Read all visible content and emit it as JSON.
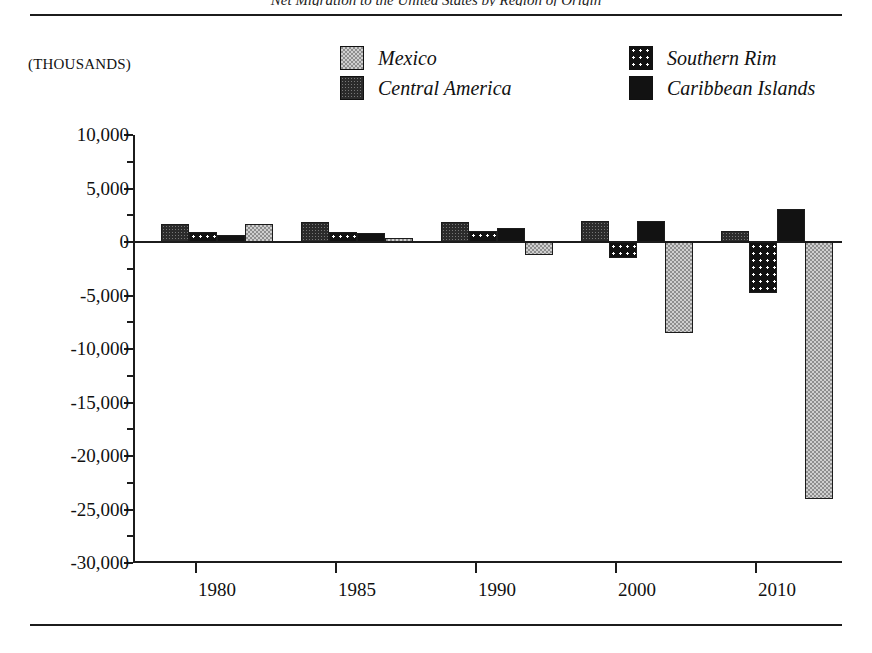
{
  "figure": {
    "clipped_title": "Net Migration to the United States by Region of Origin",
    "units_label": "(THOUSANDS)"
  },
  "legend": {
    "entries": [
      {
        "label": "Mexico",
        "key": "mexico",
        "swatch": "gray-checkered-swatch"
      },
      {
        "label": "Southern Rim",
        "key": "southern",
        "swatch": "black-dotted-swatch"
      },
      {
        "label": "Central America",
        "key": "central",
        "swatch": "dark-stippled-swatch"
      },
      {
        "label": "Caribbean Islands",
        "key": "caribbean",
        "swatch": "solid-black-swatch"
      }
    ]
  },
  "chart_data": {
    "type": "bar",
    "title": "Net Migration to the United States by Region of Origin",
    "xlabel": "",
    "ylabel": "(THOUSANDS)",
    "ylim": [
      -30000,
      10000
    ],
    "ytick_step": 5000,
    "yminor_step": 2500,
    "grid": false,
    "legend_position": "top-right",
    "categories": [
      "1980",
      "1985",
      "1990",
      "2000",
      "2010"
    ],
    "ytick_labels": [
      "10,000",
      "5,000",
      "0",
      "-5,000",
      "-10,000",
      "-15,000",
      "-20,000",
      "-25,000",
      "-30,000"
    ],
    "ytick_values": [
      10000,
      5000,
      0,
      -5000,
      -10000,
      -15000,
      -20000,
      -25000,
      -30000
    ],
    "series": [
      {
        "name": "Central America",
        "key": "central",
        "values": [
          1700,
          1900,
          1900,
          1950,
          1000
        ]
      },
      {
        "name": "Southern Rim",
        "key": "southern",
        "values": [
          900,
          900,
          1000,
          -1500,
          -4800
        ]
      },
      {
        "name": "Caribbean Islands",
        "key": "caribbean",
        "values": [
          700,
          800,
          1300,
          1950,
          3100
        ]
      },
      {
        "name": "Mexico",
        "key": "mexico",
        "values": [
          1700,
          400,
          -1200,
          -8500,
          -24000
        ]
      }
    ]
  }
}
